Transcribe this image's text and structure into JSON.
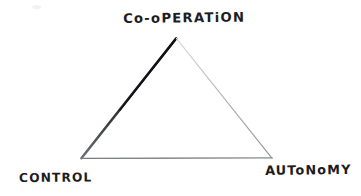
{
  "diagram": {
    "title_label": "Co-oPERATiON",
    "left_label": "CONTROL",
    "right_label": "AUToNoMY",
    "shape": "triangle",
    "background_color": "#ffffff",
    "ink_color": "#1d1d1d",
    "edges": {
      "left_edge": {
        "name": "control-to-cooperation-edge",
        "color": "#15151a",
        "weight": "heavy"
      },
      "right_edge": {
        "name": "cooperation-to-autonomy-edge",
        "color": "#b9bcc0",
        "weight": "light"
      },
      "bottom_edge": {
        "name": "control-to-autonomy-edge",
        "color": "#8a8d92",
        "weight": "light"
      }
    },
    "vertices": {
      "apex": {
        "name": "cooperation-vertex",
        "x": 176,
        "y": 38
      },
      "bottom_left": {
        "name": "control-vertex",
        "x": 81,
        "y": 158
      },
      "bottom_right": {
        "name": "autonomy-vertex",
        "x": 272,
        "y": 158
      }
    }
  }
}
